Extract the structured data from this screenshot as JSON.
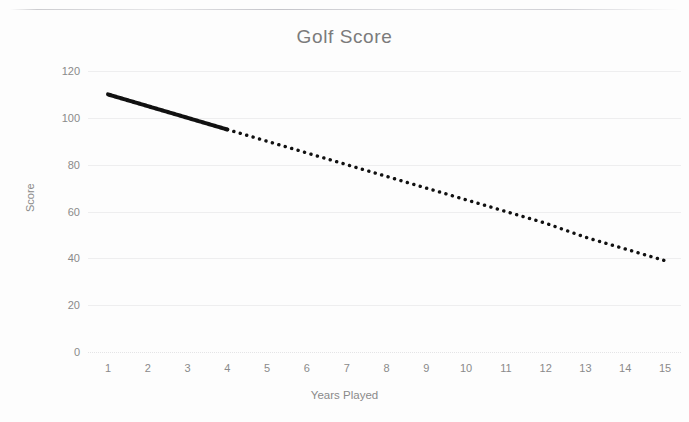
{
  "document": {
    "kind": "scanned-chart-page",
    "background_color": "#fdfdfd"
  },
  "chart_data": {
    "type": "line",
    "title": "Golf Score",
    "xlabel": "Years Played",
    "ylabel": "Score",
    "x": [
      1,
      2,
      3,
      4,
      5,
      6,
      7,
      8,
      9,
      10,
      11,
      12,
      13,
      14,
      15
    ],
    "categories": [
      "1",
      "2",
      "3",
      "4",
      "5",
      "6",
      "7",
      "8",
      "9",
      "10",
      "11",
      "12",
      "13",
      "14",
      "15"
    ],
    "series": [
      {
        "name": "Golf Score",
        "values": [
          110,
          105,
          100,
          95,
          90,
          85,
          80,
          75,
          70,
          65,
          60,
          55,
          49,
          44,
          39
        ],
        "color": "#111111",
        "segments": [
          {
            "style": "solid",
            "from_x": 1,
            "to_x": 4,
            "width": 4
          },
          {
            "style": "dotted",
            "from_x": 4,
            "to_x": 15,
            "width": 3.4
          }
        ]
      }
    ],
    "ylim": [
      0,
      120
    ],
    "xlim": [
      1,
      15
    ],
    "yticks": [
      120,
      100,
      80,
      60,
      40,
      20,
      0
    ],
    "ytick_labels": [
      "120",
      "100",
      "80",
      "60",
      "40",
      "20",
      "0"
    ],
    "xtick_labels": [
      "1",
      "2",
      "3",
      "4",
      "5",
      "6",
      "7",
      "8",
      "9",
      "10",
      "11",
      "12",
      "13",
      "14",
      "15"
    ],
    "grid": {
      "horizontal": true,
      "vertical": false,
      "color": "#eeeeef",
      "baseline_style": "dotted"
    },
    "legend": {
      "visible": false,
      "position": "none"
    },
    "title_color": "#7b7b7b",
    "tick_color": "#8a8a8a"
  }
}
